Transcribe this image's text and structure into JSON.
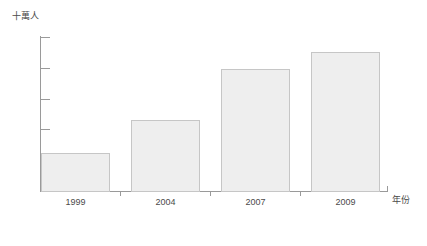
{
  "chart_data": {
    "type": "bar",
    "title": "",
    "subtitle": "",
    "categories": [
      "1999",
      "2004",
      "2007",
      "2009"
    ],
    "values": [
      6.4,
      11.7,
      19.9,
      22.8
    ],
    "series": [
      {
        "name": "",
        "values": [
          6.4,
          11.7,
          19.9,
          22.8
        ]
      }
    ],
    "xlabel": "年份",
    "ylabel": "十萬人",
    "ylim": [
      0,
      25
    ],
    "y_ticks": [
      0,
      5,
      10,
      15,
      20,
      25
    ],
    "y_tick_labels": [
      "0",
      "5",
      "10",
      "15",
      "20",
      "25"
    ],
    "x_tick_labels": [
      "1999",
      "2004",
      "2007",
      "2009"
    ],
    "grid": false,
    "legend": false,
    "legend_position": "none",
    "bar_fill_color": "#eeeeee",
    "bar_border_color": "#c6c6c6",
    "axis_color": "#9a9a9a",
    "text_color": "#4a4a4a",
    "background_color": "#ffffff",
    "annotations": []
  },
  "axes": {
    "y_title": "十萬人",
    "x_title": "年份"
  }
}
